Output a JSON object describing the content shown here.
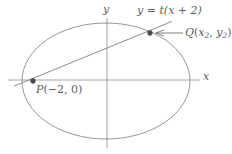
{
  "figure": {
    "kind": "analytic-geometry-diagram",
    "background_color": "#ffffff",
    "stroke_color": "#8a8a8a",
    "label_color": "#5d5d5d",
    "point_color": "#4a4a4a",
    "width": 232,
    "height": 154
  },
  "axes": {
    "x_label": "x",
    "y_label": "y",
    "origin": {
      "x": 107,
      "y": 80
    },
    "x_axis": {
      "x1": 8,
      "y1": 80,
      "x2": 200,
      "y2": 80
    },
    "y_axis": {
      "x1": 107,
      "y1": 18,
      "x2": 107,
      "y2": 148
    }
  },
  "ellipse": {
    "center_x": 106,
    "center_y": 81,
    "radius_x": 84,
    "radius_y": 58
  },
  "line": {
    "equation": "y = t(x + 2)",
    "equation_parts": {
      "lhs": "y",
      "equals": "=",
      "slope_symbol": "t",
      "rhs": "(x + 2)"
    },
    "endpoints": {
      "x1": 14,
      "y1": 86.1,
      "x2": 172,
      "y2": 21.4
    }
  },
  "points": [
    {
      "id": "P",
      "label": "P(−2, 0)",
      "label_name": "P",
      "coordinates_text": "(−2, 0)",
      "x_value": "−2",
      "y_value": "0",
      "px": 33,
      "py": 81,
      "dot_radius": 2.4
    },
    {
      "id": "Q",
      "label": "Q(x2, y2)",
      "label_name": "Q",
      "x_value": "x",
      "x_subscript": "2",
      "y_value": "y",
      "y_subscript": "2",
      "px": 150,
      "py": 33,
      "dot_radius": 2.4
    }
  ],
  "annotation_arrow": {
    "name": "q-pointer-arrow",
    "from_x": 183,
    "from_y": 33,
    "to_x": 154,
    "to_y": 33
  },
  "chart_data": {
    "type": "scatter",
    "title": "",
    "xlabel": "x",
    "ylabel": "y",
    "grid": false,
    "legend": null,
    "curves": [
      {
        "name": "ellipse",
        "kind": "conic-ellipse",
        "center": [
          0,
          0
        ],
        "semi_axis_x": 84,
        "semi_axis_y": 58
      },
      {
        "name": "secant-line",
        "kind": "line",
        "equation": "y = t(x + 2)",
        "passes_through": [
          "P(-2, 0)",
          "Q(x2, y2)"
        ]
      }
    ],
    "points": [
      {
        "label": "P(-2, 0)",
        "x": -2,
        "y": 0
      },
      {
        "label": "Q(x2, y2)",
        "x": null,
        "y": null
      }
    ],
    "annotations": [
      {
        "text": "y = t(x + 2)",
        "target": "secant-line"
      },
      {
        "text": "Q(x2, y2)",
        "target": "point-Q",
        "arrow": true
      },
      {
        "text": "P(-2, 0)",
        "target": "point-P",
        "arrow": false
      }
    ]
  }
}
